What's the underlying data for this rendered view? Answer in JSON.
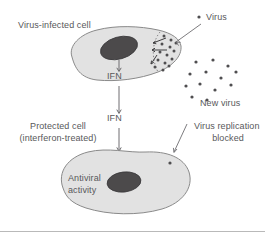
{
  "figure": {
    "background_color": "#ffffff",
    "cell_fill_color": "#e2e2e2",
    "cell_stroke_color": "#8a8a8a",
    "nucleus_color": "#4c4a4b",
    "virus_particle_color": "#4f4e50",
    "text_color": "#58585a"
  },
  "labels": {
    "infected_cell": "Virus-infected cell",
    "virus": "Virus",
    "new_virus": "New virus",
    "ifn_intracellular": "IFN",
    "ifn_extracellular": "IFN",
    "protected_cell_line1": "Protected cell",
    "protected_cell_line2": "(interferon-treated)",
    "virus_replication_line1": "Virus replication",
    "virus_replication_line2": "blocked",
    "antiviral_line1": "Antiviral",
    "antiviral_line2": "activity"
  },
  "diagram_elements": {
    "cells": [
      {
        "name": "virus-infected-cell",
        "state": "infected",
        "nucleus": true
      },
      {
        "name": "protected-cell",
        "state": "interferon-treated",
        "nucleus": true
      }
    ],
    "virus_clusters": [
      {
        "name": "replication-cluster",
        "location": "inside-infected-cell",
        "count": 14
      },
      {
        "name": "released-virions",
        "location": "extracellular",
        "count": 13
      },
      {
        "name": "blocked-virion",
        "location": "inside-protected-cell",
        "count": 1
      }
    ],
    "signal_flow": [
      {
        "from": "infected-cell-nucleus",
        "to": "ifn-intracellular"
      },
      {
        "from": "ifn-intracellular",
        "to": "ifn-extracellular"
      },
      {
        "from": "ifn-extracellular",
        "to": "protected-cell"
      }
    ],
    "leader_lines": [
      {
        "label": "virus",
        "points_to": "infected-cell-membrane"
      },
      {
        "label": "virus-replication-blocked",
        "points_to": "protected-cell-membrane"
      }
    ]
  }
}
